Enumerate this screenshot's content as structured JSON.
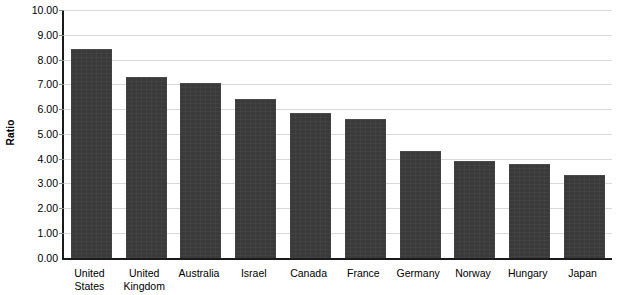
{
  "chart_data": {
    "type": "bar",
    "title": "",
    "subtitle": "",
    "xlabel": "",
    "ylabel": "Ratio",
    "ylim": [
      0,
      10
    ],
    "ytick_step": 1,
    "ytick_labels": [
      "10.00",
      "9.00",
      "8.00",
      "7.00",
      "6.00",
      "5.00",
      "4.00",
      "3.00",
      "2.00",
      "1.00",
      "0.00"
    ],
    "ytick_values": [
      10,
      9,
      8,
      7,
      6,
      5,
      4,
      3,
      2,
      1,
      0
    ],
    "grid": true,
    "legend": false,
    "bar_color": "#3a3a3a",
    "gridline_color": "#d9d9d9",
    "axis_color": "#1a1a1a",
    "categories": [
      "United States",
      "United Kingdom",
      "Australia",
      "Israel",
      "Canada",
      "France",
      "Germany",
      "Norway",
      "Hungary",
      "Japan"
    ],
    "category_label_lines": [
      [
        "United",
        "States"
      ],
      [
        "United",
        "Kingdom"
      ],
      [
        "Australia",
        ""
      ],
      [
        "Israel",
        ""
      ],
      [
        "Canada",
        ""
      ],
      [
        "France",
        ""
      ],
      [
        "Germany",
        ""
      ],
      [
        "Norway",
        ""
      ],
      [
        "Hungary",
        ""
      ],
      [
        "Japan",
        ""
      ]
    ],
    "values": [
      8.4,
      7.25,
      7.0,
      6.35,
      5.8,
      5.55,
      4.25,
      3.85,
      3.75,
      3.3
    ]
  }
}
